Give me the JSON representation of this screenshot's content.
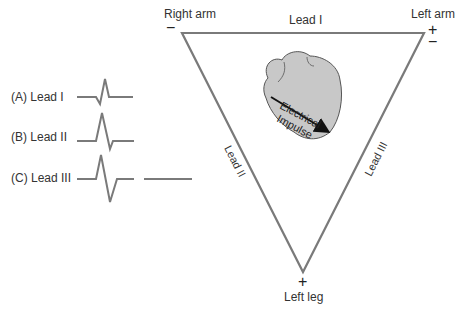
{
  "diagram": {
    "vertices": {
      "right_arm": {
        "label": "Right arm",
        "sign": "−"
      },
      "left_arm": {
        "label": "Left arm",
        "signs": [
          "+",
          "−"
        ]
      },
      "left_leg": {
        "label": "Left leg",
        "sign": "+"
      }
    },
    "edges": {
      "top": "Lead I",
      "left": "Lead II",
      "right": "Lead III"
    },
    "heart": {
      "label_line1": "Electrical",
      "label_line2": "Impulse",
      "fill": "#c8c8c8"
    },
    "waveforms": [
      {
        "label": "(A) Lead I"
      },
      {
        "label": "(B) Lead II"
      },
      {
        "label": "(C) Lead III"
      }
    ],
    "colors": {
      "line": "#7a7a7a",
      "text": "#333333",
      "arrow": "#111111"
    }
  }
}
